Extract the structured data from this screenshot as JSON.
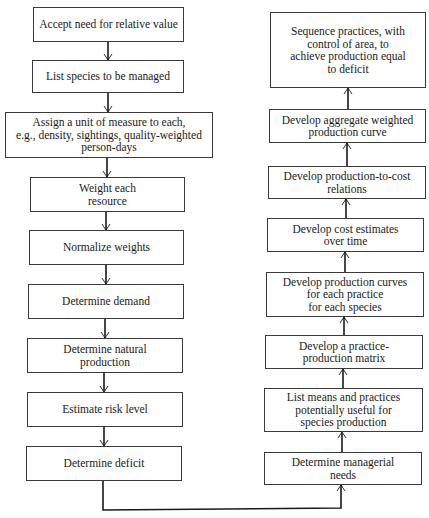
{
  "diagram": {
    "type": "flowchart",
    "left_column": [
      {
        "id": "accept",
        "label": "Accept need for relative value"
      },
      {
        "id": "list-species",
        "label": "List species to be managed"
      },
      {
        "id": "assign-unit",
        "label": "Assign a unit of measure to each,\ne.g., density, sightings, quality-weighted\nperson-days"
      },
      {
        "id": "weight",
        "label": "Weight each\nresource"
      },
      {
        "id": "normalize",
        "label": "Normalize weights"
      },
      {
        "id": "demand",
        "label": "Determine demand"
      },
      {
        "id": "natural",
        "label": "Determine natural\nproduction"
      },
      {
        "id": "risk",
        "label": "Estimate risk level"
      },
      {
        "id": "deficit",
        "label": "Determine deficit"
      }
    ],
    "right_column": [
      {
        "id": "sequence",
        "label": "Sequence practices, with\ncontrol of area, to\nachieve production equal\nto deficit"
      },
      {
        "id": "aggregate",
        "label": "Develop aggregate weighted\nproduction curve"
      },
      {
        "id": "prod-cost",
        "label": "Develop production-to-cost\nrelations"
      },
      {
        "id": "cost-est",
        "label": "Develop cost estimates\nover time"
      },
      {
        "id": "prod-curves",
        "label": "Develop production curves\nfor each practice\nfor each species"
      },
      {
        "id": "matrix",
        "label": "Develop a practice-\nproduction matrix"
      },
      {
        "id": "list-means",
        "label": "List means and practices\npotentially useful for\nspecies production"
      },
      {
        "id": "managerial",
        "label": "Determine managerial\nneeds"
      }
    ],
    "flow": "Left column flows top-to-bottom; 'Determine deficit' connects to 'Determine managerial needs'; right column flows bottom-to-top."
  }
}
